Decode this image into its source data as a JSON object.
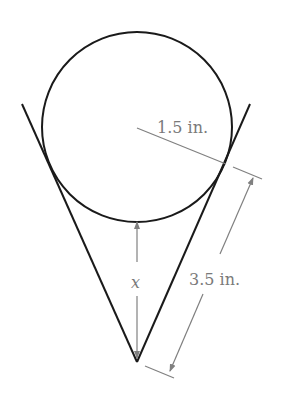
{
  "figure": {
    "labels": {
      "radius": "1.5 in.",
      "slant": "3.5 in.",
      "height": "x"
    }
  },
  "colors": {
    "outline": "#1a1a1a",
    "dimension": "#808080",
    "label": "#7a7a7a"
  }
}
